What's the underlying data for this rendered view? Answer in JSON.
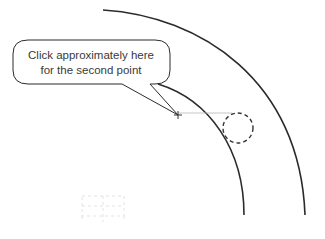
{
  "callout": {
    "line1": "Click approximately here",
    "line2": "for the second point"
  },
  "colors": {
    "stroke": "#2b2b2b",
    "text": "#3a3a3a",
    "guide_line": "#b8b8b8",
    "faint_grid": "#d6d6d6"
  },
  "elements": {
    "outer_arc": "outer-arc",
    "inner_arc": "inner-arc",
    "crosshair": "crosshair-point",
    "snap_circle": "dashed-snap-circle",
    "tracking_line": "horizontal-tracking-line",
    "ghost_grid": "faint-dashed-grid"
  }
}
